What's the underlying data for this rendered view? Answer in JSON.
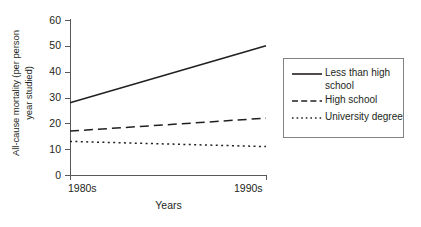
{
  "chart_data": {
    "type": "line",
    "title": "",
    "xlabel": "Years",
    "ylabel": "All-cause mortality (per person\nyear studied)",
    "ylabel_line1": "All-cause mortality (per person",
    "ylabel_line2": "year studied)",
    "x": [
      "1980s",
      "1990s"
    ],
    "xtick_labels": [
      "1980s",
      "1990s"
    ],
    "ytick_labels": [
      "0",
      "10",
      "20",
      "30",
      "40",
      "50",
      "60"
    ],
    "ytick_values": [
      0,
      10,
      20,
      30,
      40,
      50,
      60
    ],
    "ylim": [
      0,
      60
    ],
    "grid": false,
    "legend_position": "right",
    "series": [
      {
        "name": "Less than high school",
        "legend_label_line1": "Less than high",
        "legend_label_line2": "school",
        "style": "solid",
        "color": "#231f20",
        "values": [
          28,
          50
        ]
      },
      {
        "name": "High school",
        "legend_label_line1": "High school",
        "legend_label_line2": "",
        "style": "dashed",
        "color": "#231f20",
        "values": [
          17,
          22
        ]
      },
      {
        "name": "University degree",
        "legend_label_line1": "University degree",
        "legend_label_line2": "",
        "style": "dotted",
        "color": "#231f20",
        "values": [
          13,
          11
        ]
      }
    ]
  },
  "axis": {
    "line_color": "#58595b",
    "x_title": "Years"
  },
  "legend": {
    "border_color": "#808285",
    "entries": [
      {
        "label": "Less than high school",
        "line1": "Less than high",
        "line2": "school",
        "style": "solid"
      },
      {
        "label": "High school",
        "line1": "High school",
        "line2": "",
        "style": "dashed"
      },
      {
        "label": "University degree",
        "line1": "University degree",
        "line2": "",
        "style": "dotted"
      }
    ]
  }
}
